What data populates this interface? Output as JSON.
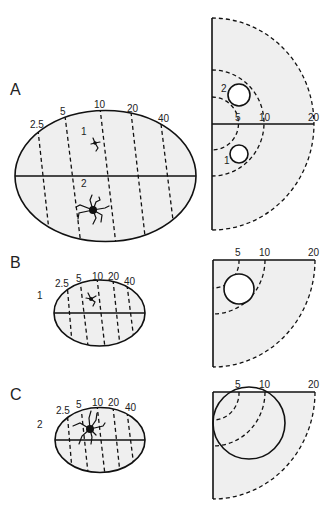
{
  "panels": [
    {
      "label": "A",
      "ellipse_ticks": [
        "2.5",
        "5",
        "10",
        "20",
        "40"
      ],
      "cells": [
        {
          "label": "1"
        },
        {
          "label": "2"
        }
      ],
      "semicircle_ticks": [
        "5",
        "10",
        "20"
      ],
      "circles": [
        {
          "label": "2"
        },
        {
          "label": "1"
        }
      ]
    },
    {
      "label": "B",
      "side_label": "1",
      "ellipse_ticks": [
        "2.5",
        "5",
        "10",
        "20",
        "40"
      ],
      "quarter_ticks": [
        "5",
        "10",
        "20"
      ]
    },
    {
      "label": "C",
      "side_label": "2",
      "ellipse_ticks": [
        "2.5",
        "5",
        "10",
        "20",
        "40"
      ],
      "quarter_ticks": [
        "5",
        "10",
        "20"
      ]
    }
  ],
  "colors": {
    "fill": "#efefef",
    "stroke": "#111111",
    "background": "#ffffff"
  }
}
